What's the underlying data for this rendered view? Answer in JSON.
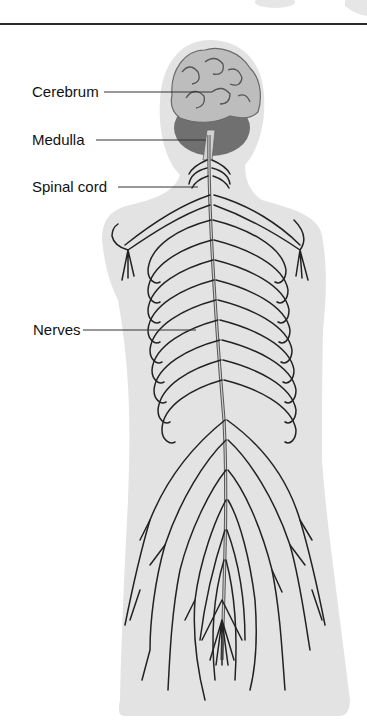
{
  "diagram": {
    "labels": [
      {
        "id": "cerebrum",
        "text": "Cerebrum"
      },
      {
        "id": "medulla",
        "text": "Medulla"
      },
      {
        "id": "spinal_cord",
        "text": "Spinal cord"
      },
      {
        "id": "nerves",
        "text": "Nerves"
      }
    ]
  },
  "colors": {
    "silhouette": "#e3e3e3",
    "nerve": "#222222",
    "brain_dark": "#6e6e6e",
    "brain_light": "#bdbdbd",
    "rule": "#2a2a2a"
  }
}
